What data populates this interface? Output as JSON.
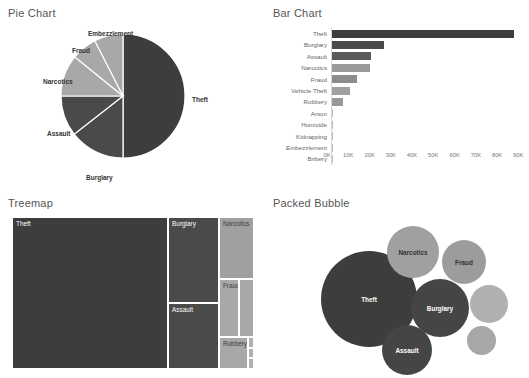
{
  "panels": {
    "pie": {
      "title": "Pie Chart"
    },
    "bar": {
      "title": "Bar Chart"
    },
    "treemap": {
      "title": "Treemap"
    },
    "bubble": {
      "title": "Packed Bubble"
    }
  },
  "colors": {
    "dark": "#3d3d3d",
    "mid_dark": "#4a4a4a",
    "mid": "#6e6e6e",
    "mid_light": "#8c8c8c",
    "light": "#a8a8a8",
    "lighter": "#b5b5b5",
    "axis": "#d8d8d8",
    "tick_text": "#777777",
    "cat_text": "#666666",
    "title_text": "#555555",
    "background": "#ffffff"
  },
  "chart_data": [
    {
      "type": "pie",
      "title": "Pie Chart",
      "categories": [
        "Theft",
        "Burglary",
        "Assault",
        "Narcotics",
        "Fraud",
        "Embezzlement"
      ],
      "values": [
        91000,
        26000,
        19500,
        19000,
        12500,
        8000
      ],
      "labels_shown": [
        "Theft",
        "Burglary",
        "Assault",
        "Narcotics",
        "Fraud",
        "Embezzlement"
      ],
      "legend": "none",
      "grid": false
    },
    {
      "type": "bar",
      "title": "Bar Chart",
      "orientation": "horizontal",
      "categories": [
        "Theft",
        "Burglary",
        "Assault",
        "Narcotics",
        "Fraud",
        "Vehicle Theft",
        "Robbery",
        "Arson",
        "Homicide",
        "Kidnapping",
        "Embezzlement",
        "Bribery"
      ],
      "values": [
        90500,
        26000,
        19500,
        19000,
        12500,
        9000,
        5500,
        400,
        300,
        200,
        150,
        100
      ],
      "xlabel": "",
      "ylabel": "",
      "xlim": [
        0,
        95000
      ],
      "xticks": [
        "0K",
        "10K",
        "20K",
        "30K",
        "40K",
        "50K",
        "60K",
        "70K",
        "80K",
        "90K"
      ],
      "xtick_values": [
        0,
        10000,
        20000,
        30000,
        40000,
        50000,
        60000,
        70000,
        80000,
        90000
      ],
      "grid": true,
      "legend": "none"
    },
    {
      "type": "treemap",
      "title": "Treemap",
      "categories": [
        "Theft",
        "Burglary",
        "Assault",
        "Narcotics",
        "Fraud",
        "Vehicle Theft",
        "Robbery",
        "Arson",
        "Homicide",
        "Kidnapping"
      ],
      "values": [
        90500,
        26000,
        19500,
        19000,
        12500,
        9000,
        5500,
        400,
        300,
        200
      ],
      "labels_shown": [
        "Theft",
        "Burglary",
        "Assault",
        "Narcotics",
        "Fraud",
        "Robbery"
      ],
      "legend": "none"
    },
    {
      "type": "packed_bubble",
      "title": "Packed Bubble",
      "categories": [
        "Theft",
        "Burglary",
        "Narcotics",
        "Assault",
        "Fraud",
        "Vehicle Theft",
        "Robbery"
      ],
      "values": [
        90500,
        26000,
        19000,
        19500,
        12500,
        9000,
        5500
      ],
      "labels_shown": [
        "Theft",
        "Burglary",
        "Narcotics",
        "Assault",
        "Fraud"
      ],
      "legend": "none"
    }
  ],
  "pie_slices": [
    {
      "label": "Theft",
      "start_deg": 0,
      "end_deg": 180,
      "color": "#3d3d3d",
      "label_x": 192,
      "label_y": 96
    },
    {
      "label": "Burglary",
      "start_deg": 180,
      "end_deg": 232,
      "color": "#4a4a4a",
      "label_x": 86,
      "label_y": 174
    },
    {
      "label": "Assault",
      "start_deg": 232,
      "end_deg": 270,
      "color": "#4a4a4a",
      "label_x": 47,
      "label_y": 130
    },
    {
      "label": "Narcotics",
      "start_deg": 270,
      "end_deg": 309,
      "color": "#a8a8a8",
      "label_x": 43,
      "label_y": 78
    },
    {
      "label": "Fraud",
      "start_deg": 309,
      "end_deg": 333,
      "color": "#a8a8a8",
      "label_x": 72,
      "label_y": 47
    },
    {
      "label": "Embezzlement",
      "start_deg": 333,
      "end_deg": 360,
      "color": "#a8a8a8",
      "label_x": 88,
      "label_y": 30
    }
  ],
  "bar_rows": [
    {
      "label": "Theft",
      "value": 90500,
      "pct": 95.3,
      "color": "#3d3d3d"
    },
    {
      "label": "Burglary",
      "value": 26000,
      "pct": 27.4,
      "color": "#4a4a4a"
    },
    {
      "label": "Assault",
      "value": 19500,
      "pct": 20.5,
      "color": "#5a5a5a"
    },
    {
      "label": "Narcotics",
      "value": 19000,
      "pct": 20.0,
      "color": "#9a9a9a"
    },
    {
      "label": "Fraud",
      "value": 12500,
      "pct": 13.2,
      "color": "#8c8c8c"
    },
    {
      "label": "Vehicle Theft",
      "value": 9000,
      "pct": 9.5,
      "color": "#a0a0a0"
    },
    {
      "label": "Robbery",
      "value": 5500,
      "pct": 5.8,
      "color": "#999999"
    },
    {
      "label": "Arson",
      "value": 400,
      "pct": 0.4,
      "color": "#bdbdbd"
    },
    {
      "label": "Homicide",
      "value": 300,
      "pct": 0.3,
      "color": "#bdbdbd"
    },
    {
      "label": "Kidnapping",
      "value": 200,
      "pct": 0.2,
      "color": "#bdbdbd"
    },
    {
      "label": "Embezzlement",
      "value": 150,
      "pct": 0.15,
      "color": "#bdbdbd"
    },
    {
      "label": "Bribery",
      "value": 100,
      "pct": 0.1,
      "color": "#bdbdbd"
    }
  ],
  "bar_ticks": [
    {
      "label": "0K",
      "pos_pct": 0
    },
    {
      "label": "10K",
      "pos_pct": 10.5
    },
    {
      "label": "20K",
      "pos_pct": 21.1
    },
    {
      "label": "30K",
      "pos_pct": 31.6
    },
    {
      "label": "40K",
      "pos_pct": 42.1
    },
    {
      "label": "50K",
      "pos_pct": 52.6
    },
    {
      "label": "60K",
      "pos_pct": 63.2
    },
    {
      "label": "70K",
      "pos_pct": 73.7
    },
    {
      "label": "80K",
      "pos_pct": 84.2
    },
    {
      "label": "90K",
      "pos_pct": 94.7
    }
  ],
  "treemap_cells": [
    {
      "label": "Theft",
      "x": 0,
      "y": 0,
      "w": 64.5,
      "h": 100,
      "color": "#3d3d3d",
      "label_color": "light",
      "show_label": true
    },
    {
      "label": "Burglary",
      "x": 64.5,
      "y": 0,
      "w": 21.0,
      "h": 56.5,
      "color": "#4a4a4a",
      "label_color": "light",
      "show_label": true
    },
    {
      "label": "Assault",
      "x": 64.5,
      "y": 56.5,
      "w": 21.0,
      "h": 43.5,
      "color": "#4a4a4a",
      "label_color": "light",
      "show_label": true
    },
    {
      "label": "Narcotics",
      "x": 85.5,
      "y": 0,
      "w": 14.5,
      "h": 41.0,
      "color": "#a0a0a0",
      "label_color": "dark",
      "show_label": true
    },
    {
      "label": "Fraud",
      "x": 85.5,
      "y": 41.0,
      "w": 8.5,
      "h": 38.0,
      "color": "#a8a8a8",
      "label_color": "dark",
      "show_label": true
    },
    {
      "label": "Vehicle Theft",
      "x": 94.0,
      "y": 41.0,
      "w": 6.0,
      "h": 38.0,
      "color": "#a8a8a8",
      "label_color": "dark",
      "show_label": false
    },
    {
      "label": "Robbery",
      "x": 85.5,
      "y": 79.0,
      "w": 12.0,
      "h": 21.0,
      "color": "#a8a8a8",
      "label_color": "dark",
      "show_label": true
    },
    {
      "label": "Arson",
      "x": 97.5,
      "y": 79.0,
      "w": 2.5,
      "h": 7.5,
      "color": "#b0b0b0",
      "label_color": "dark",
      "show_label": false
    },
    {
      "label": "Homicide",
      "x": 97.5,
      "y": 86.5,
      "w": 2.5,
      "h": 6.0,
      "color": "#b0b0b0",
      "label_color": "dark",
      "show_label": false
    },
    {
      "label": "Kidnapping",
      "x": 97.5,
      "y": 92.5,
      "w": 2.5,
      "h": 7.5,
      "color": "#b0b0b0",
      "label_color": "dark",
      "show_label": false
    }
  ],
  "bubbles": [
    {
      "label": "Theft",
      "cx": 104,
      "cy": 92,
      "r": 48,
      "color": "#3d3d3d",
      "label_color": "light",
      "show_label": true
    },
    {
      "label": "Burglary",
      "cx": 175,
      "cy": 101,
      "r": 29,
      "color": "#454545",
      "label_color": "light",
      "show_label": true
    },
    {
      "label": "Narcotics",
      "cx": 148,
      "cy": 45,
      "r": 26,
      "color": "#a0a0a0",
      "label_color": "dark",
      "show_label": true
    },
    {
      "label": "Assault",
      "cx": 142,
      "cy": 143,
      "r": 25,
      "color": "#454545",
      "label_color": "light",
      "show_label": true
    },
    {
      "label": "Fraud",
      "cx": 199,
      "cy": 55,
      "r": 22,
      "color": "#9c9c9c",
      "label_color": "dark",
      "show_label": true
    },
    {
      "label": "Vehicle Theft",
      "cx": 224,
      "cy": 97,
      "r": 19,
      "color": "#b0b0b0",
      "label_color": "dark",
      "show_label": false
    },
    {
      "label": "Robbery",
      "cx": 216,
      "cy": 133,
      "r": 14.5,
      "color": "#a8a8a8",
      "label_color": "dark",
      "show_label": false
    }
  ]
}
